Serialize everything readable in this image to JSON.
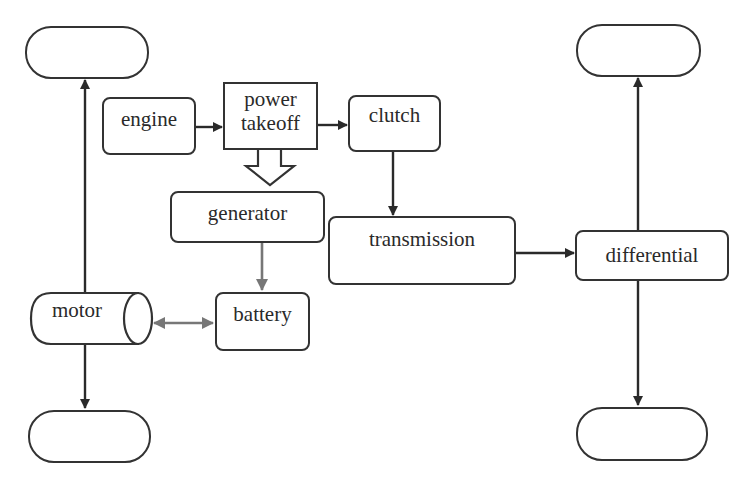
{
  "diagram": {
    "wheels": {
      "front_left": "",
      "rear_left": "",
      "front_right": "",
      "rear_right": ""
    },
    "nodes": {
      "engine": "engine",
      "power_takeoff_line1": "power",
      "power_takeoff_line2": "takeoff",
      "clutch": "clutch",
      "generator": "generator",
      "transmission": "transmission",
      "differential": "differential",
      "motor": "motor",
      "battery": "battery"
    },
    "edges": [
      {
        "from": "engine",
        "to": "power takeoff",
        "style": "solid-dark"
      },
      {
        "from": "power takeoff",
        "to": "clutch",
        "style": "solid-dark"
      },
      {
        "from": "power takeoff",
        "to": "generator",
        "style": "hollow-block-arrow"
      },
      {
        "from": "clutch",
        "to": "transmission",
        "style": "solid-dark"
      },
      {
        "from": "transmission",
        "to": "differential",
        "style": "solid-dark"
      },
      {
        "from": "differential",
        "to": "front_right wheel",
        "style": "solid-dark"
      },
      {
        "from": "differential",
        "to": "rear_right wheel",
        "style": "solid-dark"
      },
      {
        "from": "motor",
        "to": "front_left wheel",
        "style": "solid-dark"
      },
      {
        "from": "motor",
        "to": "rear_left wheel",
        "style": "solid-dark"
      },
      {
        "from": "generator",
        "to": "battery",
        "style": "solid-gray"
      },
      {
        "from": "motor",
        "to": "battery",
        "style": "bidirectional-gray"
      }
    ],
    "colors": {
      "stroke": "#333333",
      "electric": "#777777",
      "background": "#ffffff"
    }
  }
}
